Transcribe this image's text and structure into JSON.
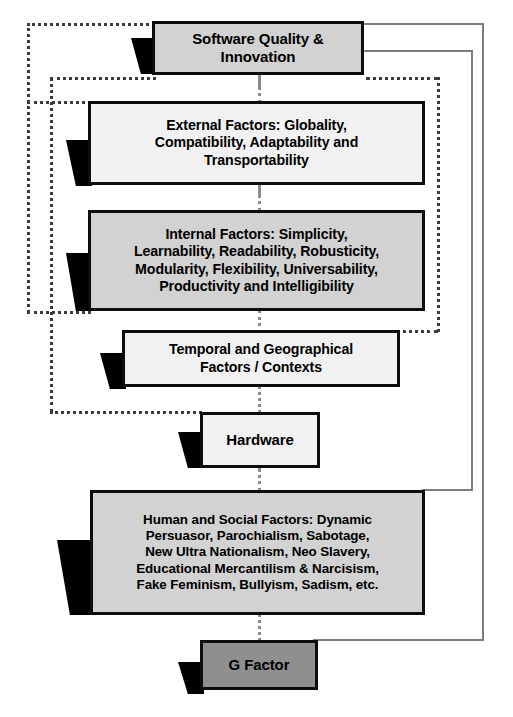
{
  "diagram": {
    "colors": {
      "node_border": "#0d0d0d",
      "fill_light": "#f1f1f1",
      "fill_mid": "#d2d2d2",
      "fill_dark": "#8f8f8f",
      "pointer": "#000000",
      "solid_connector": "#7d7d7d",
      "dotted_connector": "#3b3b3b"
    },
    "nodes": [
      {
        "id": "software-quality",
        "label": "Software Quality &\nInnovation",
        "fill": "mid"
      },
      {
        "id": "external-factors",
        "label": "External Factors:  Globality,\nCompatibility, Adaptability and\nTransportability",
        "fill": "light"
      },
      {
        "id": "internal-factors",
        "label": "Internal Factors:  Simplicity,\nLearnability, Readability, Robusticity,\nModularity, Flexibility, Universability,\nProductivity and Intelligibility",
        "fill": "mid"
      },
      {
        "id": "temporal-geographical",
        "label": "Temporal and Geographical\nFactors / Contexts",
        "fill": "light"
      },
      {
        "id": "hardware",
        "label": "Hardware",
        "fill": "light"
      },
      {
        "id": "human-social",
        "label": "Human and Social Factors:  Dynamic\nPersuasor, Parochialism, Sabotage,\nNew Ultra Nationalism, Neo Slavery,\nEducational Mercantilism & Narcisism,\nFake Feminism, Bullyism, Sadism, etc.",
        "fill": "mid"
      },
      {
        "id": "g-factor",
        "label": "G Factor",
        "fill": "dark"
      }
    ]
  }
}
